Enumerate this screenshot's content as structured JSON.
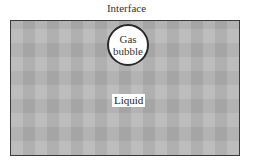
{
  "diagram": {
    "title": "Interface",
    "bubble": {
      "line1": "Gas",
      "line2": "bubble"
    },
    "region_label": "Liquid",
    "colors": {
      "liquid_fill": "#b5b5b5",
      "border": "#3a3a3a",
      "bubble_fill": "#ffffff"
    }
  }
}
